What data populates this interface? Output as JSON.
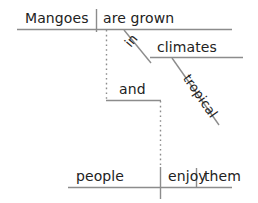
{
  "diagram": {
    "type": "reed-kellogg-sentence-diagram",
    "sentence": "Mangoes are grown in tropical climates, and people enjoy them.",
    "stroke_color": "#8c8c8c",
    "text_color": "#222222",
    "main_clause": {
      "subject": "Mangoes",
      "predicate": "are grown"
    },
    "prepositional_phrase": {
      "preposition": "in",
      "object": "climates",
      "modifier": "tropical"
    },
    "conjunction": "and",
    "second_clause": {
      "subject": "people",
      "verb": "enjoy",
      "object": "them"
    }
  }
}
